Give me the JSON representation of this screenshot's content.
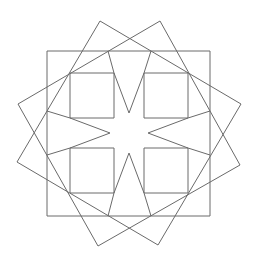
{
  "figure": {
    "title": "",
    "canvas": {
      "width": 258,
      "height": 269
    },
    "stroke_color": "#6a6a6a",
    "background": "#ffffff",
    "center": [
      129,
      133
    ]
  },
  "shapes": {
    "outer_square": [
      [
        47,
        51
      ],
      [
        210,
        51
      ],
      [
        210,
        216
      ],
      [
        47,
        216
      ]
    ],
    "tilted_square_a": [
      [
        100,
        21
      ],
      [
        241,
        104
      ],
      [
        158,
        245
      ],
      [
        17,
        162
      ]
    ],
    "tilted_square_b": [
      [
        160,
        21
      ],
      [
        240,
        165
      ],
      [
        98,
        246
      ],
      [
        18,
        104
      ]
    ],
    "inner_squares": [
      [
        [
          70,
          73
        ],
        [
          114,
          73
        ],
        [
          114,
          118
        ],
        [
          70,
          118
        ]
      ],
      [
        [
          144,
          73
        ],
        [
          188,
          73
        ],
        [
          188,
          118
        ],
        [
          144,
          118
        ]
      ],
      [
        [
          70,
          148
        ],
        [
          114,
          148
        ],
        [
          114,
          193
        ],
        [
          70,
          193
        ]
      ],
      [
        [
          144,
          148
        ],
        [
          188,
          148
        ],
        [
          188,
          193
        ],
        [
          144,
          193
        ]
      ]
    ],
    "star_segments": [
      [
        [
          114,
          73
        ],
        [
          129,
          113
        ]
      ],
      [
        [
          144,
          73
        ],
        [
          129,
          113
        ]
      ],
      [
        [
          188,
          118
        ],
        [
          148,
          133
        ]
      ],
      [
        [
          188,
          148
        ],
        [
          148,
          133
        ]
      ],
      [
        [
          144,
          193
        ],
        [
          129,
          153
        ]
      ],
      [
        [
          114,
          193
        ],
        [
          129,
          153
        ]
      ],
      [
        [
          70,
          148
        ],
        [
          110,
          133
        ]
      ],
      [
        [
          70,
          118
        ],
        [
          110,
          133
        ]
      ],
      [
        [
          114,
          73
        ],
        [
          108,
          51
        ]
      ],
      [
        [
          144,
          73
        ],
        [
          151,
          51
        ]
      ],
      [
        [
          188,
          118
        ],
        [
          210,
          111
        ]
      ],
      [
        [
          188,
          148
        ],
        [
          210,
          155
        ]
      ],
      [
        [
          144,
          193
        ],
        [
          151,
          216
        ]
      ],
      [
        [
          114,
          193
        ],
        [
          108,
          216
        ]
      ],
      [
        [
          70,
          148
        ],
        [
          47,
          155
        ]
      ],
      [
        [
          70,
          118
        ],
        [
          47,
          111
        ]
      ]
    ]
  }
}
